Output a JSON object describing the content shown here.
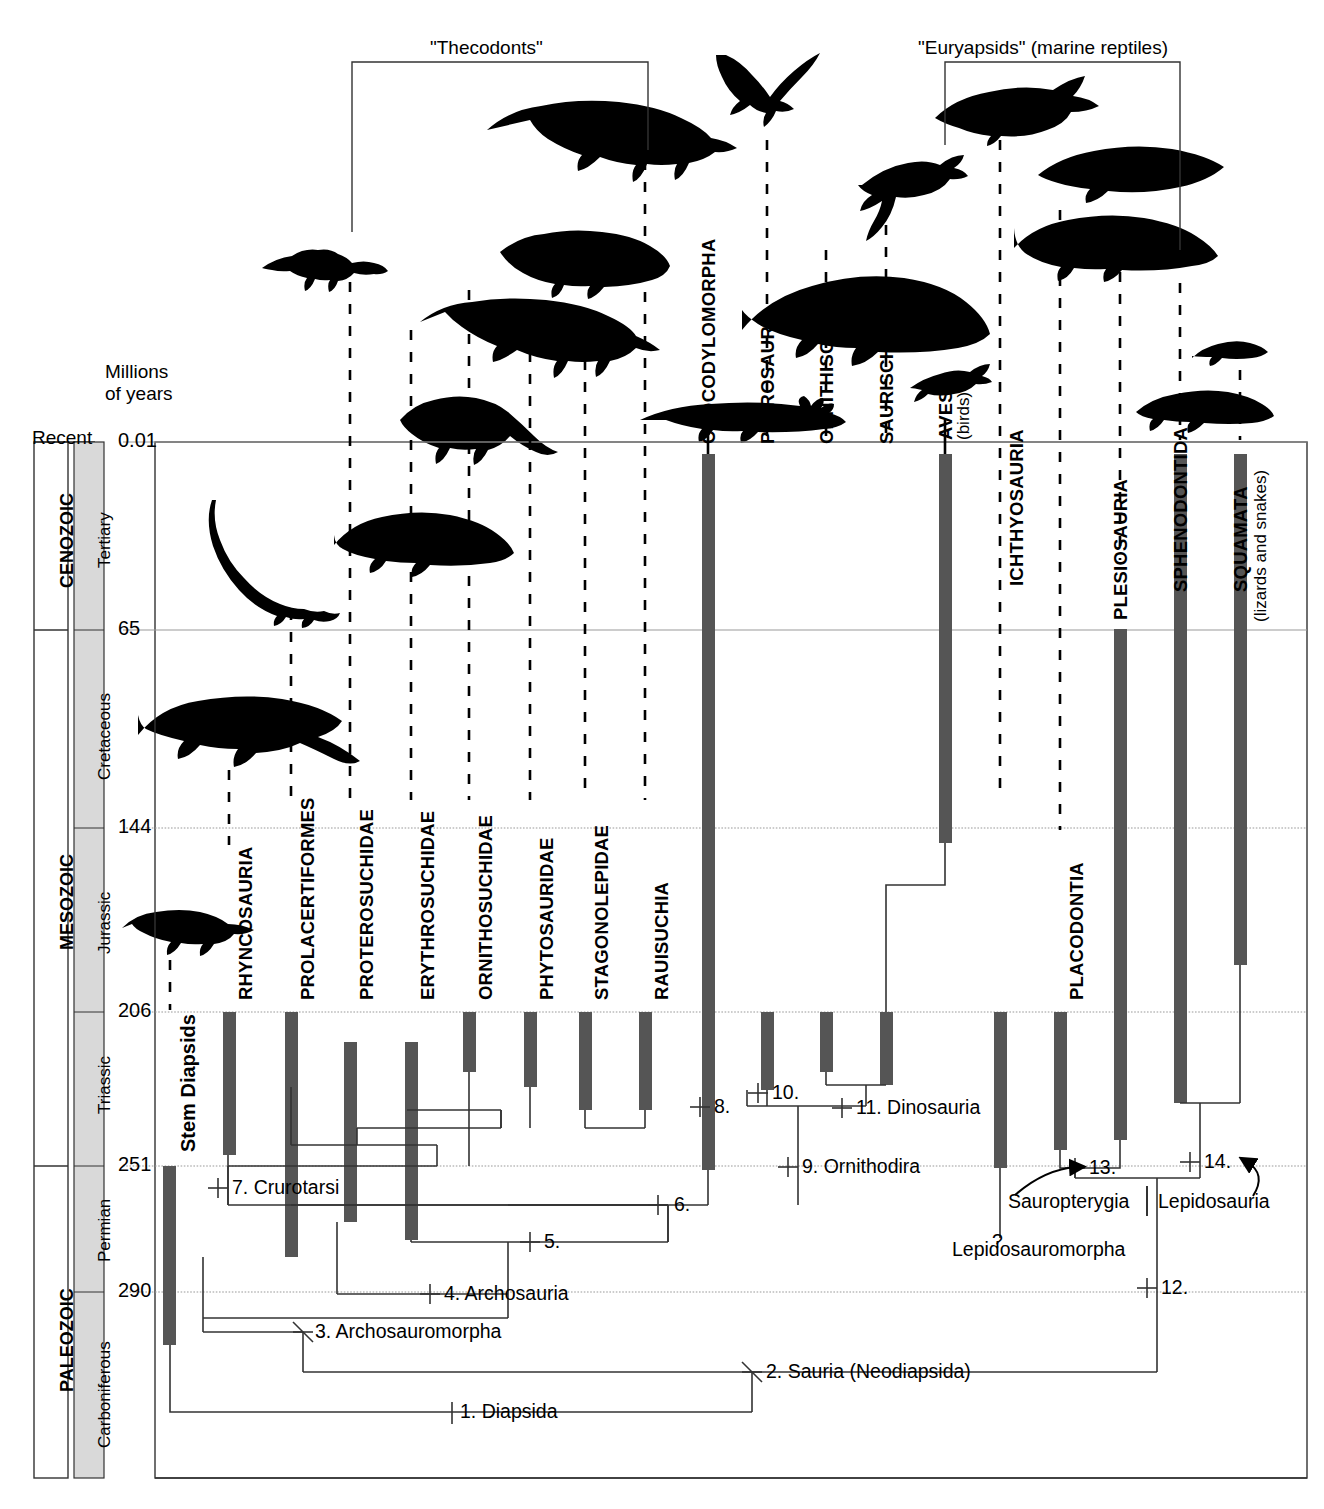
{
  "figure": {
    "title_brackets": [
      {
        "id": "thecodonts",
        "label": "\"Thecodonts\"",
        "x1": 352,
        "x2": 648,
        "y": 62,
        "label_x": 500,
        "label_y": 52
      },
      {
        "id": "euryapsids",
        "label": "\"Euryapsids\" (marine reptiles)",
        "x1": 945,
        "x2": 1180,
        "y": 62,
        "label_x": 1063,
        "label_y": 52
      }
    ],
    "axis_header": {
      "line1": "Millions",
      "line2": "of years",
      "x": 105,
      "y": 370
    },
    "recent_label": "Recent",
    "stem_label": "Stem Diapsids"
  },
  "time_axis": {
    "ticks": [
      {
        "value": "0.01",
        "y": 442
      },
      {
        "value": "65",
        "y": 630
      },
      {
        "value": "144",
        "y": 828
      },
      {
        "value": "206",
        "y": 1012
      },
      {
        "value": "251",
        "y": 1166
      },
      {
        "value": "290",
        "y": 1292
      }
    ],
    "eras": [
      {
        "name": "CENOZOIC",
        "y_top": 442,
        "y_bottom": 630
      },
      {
        "name": "MESOZOIC",
        "y_top": 630,
        "y_bottom": 1166
      },
      {
        "name": "PALEOZOIC",
        "y_top": 1166,
        "y_bottom": 1478
      }
    ],
    "periods": [
      {
        "name": "Tertiary",
        "y_top": 442,
        "y_bottom": 630
      },
      {
        "name": "Cretaceous",
        "y_top": 630,
        "y_bottom": 828
      },
      {
        "name": "Jurassic",
        "y_top": 828,
        "y_bottom": 1012
      },
      {
        "name": "Triassic",
        "y_top": 1012,
        "y_bottom": 1166
      },
      {
        "name": "Permian",
        "y_top": 1166,
        "y_bottom": 1292
      },
      {
        "name": "Carboniferous",
        "y_top": 1292,
        "y_bottom": 1478
      }
    ]
  },
  "taxa": [
    {
      "id": "stem-diapsids",
      "label": "Stem Diapsids",
      "x": 170,
      "bar_top": 1166,
      "bar_bottom": 1345,
      "label_y": 1155,
      "vertical": true,
      "bold": true,
      "dashed_top": null
    },
    {
      "id": "rhyncosauria",
      "label": "RHYNCOSAURIA",
      "x": 229,
      "bar_top": 1012,
      "bar_bottom": 1155,
      "label_y": 1000,
      "dashed_top": 200
    },
    {
      "id": "prolacertiformes",
      "label": "PROLACERTIFORMES",
      "x": 291,
      "bar_top": 1012,
      "bar_bottom": 1257,
      "label_y": 1000,
      "dashed_top": 600
    },
    {
      "id": "proterosuchidae",
      "label": "PROTEROSUCHIDAE",
      "x": 350,
      "bar_top": 1042,
      "bar_bottom": 1222,
      "label_y": 1000,
      "dashed_top": 90
    },
    {
      "id": "erythrosuchidae",
      "label": "ERYTHROSUCHIDAE",
      "x": 411,
      "bar_top": 1042,
      "bar_bottom": 1240,
      "label_y": 1000,
      "dashed_top": 290
    },
    {
      "id": "ornithosuchidae",
      "label": "ORNITHOSUCHIDAE",
      "x": 469,
      "bar_top": 1012,
      "bar_bottom": 1072,
      "label_y": 1000,
      "dashed_top": 250
    },
    {
      "id": "phytosauridae",
      "label": "PHYTOSAURIDAE",
      "x": 530,
      "bar_top": 1012,
      "bar_bottom": 1087,
      "label_y": 1000,
      "dashed_top": 280
    },
    {
      "id": "stagonolepidae",
      "label": "STAGONOLEPIDAE",
      "x": 585,
      "bar_top": 1012,
      "bar_bottom": 1110,
      "label_y": 1000,
      "dashed_top": 350
    },
    {
      "id": "rauisuchia",
      "label": "RAUISUCHIA",
      "x": 645,
      "bar_top": 1012,
      "bar_bottom": 1110,
      "label_y": 1000,
      "dashed_top": 150
    },
    {
      "id": "crocodylomorpha",
      "label": "CROCODYLOMORPHA",
      "x": 708,
      "bar_top": 454,
      "bar_bottom": 1170,
      "label_y": 444,
      "dashed_top": null
    },
    {
      "id": "pterosauria",
      "label": "PTEROSAURIA",
      "x": 767,
      "bar_top": 1012,
      "bar_bottom": 1090,
      "label_y": 1000,
      "dashed_top": 75
    },
    {
      "id": "ornithischia",
      "label": "ORNITHISCHIA",
      "x": 826,
      "bar_top": 1012,
      "bar_bottom": 1072,
      "label_y": 1000,
      "dashed_top": 165
    },
    {
      "id": "saurischia",
      "label": "SAURISCHIA",
      "x": 886,
      "bar_top": 1012,
      "bar_bottom": 1085,
      "label_y": 1000,
      "dashed_top": 170
    },
    {
      "id": "aves",
      "label": "AVES",
      "sublabel": "(birds)",
      "x": 945,
      "bar_top": 454,
      "bar_bottom": 843,
      "label_y": 440,
      "dashed_top": null
    },
    {
      "id": "ichthyosauria",
      "label": "ICHTHYOSAURIA",
      "x": 1000,
      "bar_top": 1012,
      "bar_bottom": 1168,
      "label_y": 1000,
      "dashed_top": 90
    },
    {
      "id": "placodontia",
      "label": "PLACODONTIA",
      "x": 1060,
      "bar_top": 1012,
      "bar_bottom": 1150,
      "label_y": 1000,
      "dashed_top": 140
    },
    {
      "id": "plesiosauria",
      "label": "PLESIOSAURIA",
      "x": 1120,
      "bar_top": 629,
      "bar_bottom": 1140,
      "label_y": 620,
      "dashed_top": 150
    },
    {
      "id": "sphenodontida",
      "label": "SPHENODONTIDA",
      "x": 1180,
      "bar_top": 454,
      "bar_bottom": 1103,
      "label_y": 444,
      "dashed_top": null
    },
    {
      "id": "squamata",
      "label": "SQUAMATA",
      "sublabel": "(lizards and snakes)",
      "x": 1240,
      "bar_top": 454,
      "bar_bottom": 965,
      "label_y": 444,
      "dashed_top": null
    }
  ],
  "nodes": [
    {
      "num": "1.",
      "name": "Diapsida",
      "label": "1. Diapsida",
      "x": 452,
      "y": 1412
    },
    {
      "num": "2.",
      "name": "Sauria (Neodiapsida)",
      "label": "2. Sauria (Neodiapsida)",
      "x": 752,
      "y": 1372
    },
    {
      "num": "3.",
      "name": "Archosauromorpha",
      "label": "3. Archosauromorpha",
      "x": 303,
      "y": 1332
    },
    {
      "num": "4.",
      "name": "Archosauria",
      "label": "4. Archosauria",
      "x": 440,
      "y": 1294
    },
    {
      "num": "5.",
      "name": "",
      "label": "5.",
      "x": 540,
      "y": 1242
    },
    {
      "num": "6.",
      "name": "",
      "label": "6.",
      "x": 668,
      "y": 1205
    },
    {
      "num": "7.",
      "name": "Crurotarsi",
      "label": "7. Crurotarsi",
      "x": 527,
      "y": 1188
    },
    {
      "num": "8.",
      "name": "",
      "label": "8.",
      "x": 710,
      "y": 1107
    },
    {
      "num": "9.",
      "name": "Ornithodira",
      "label": "9. Ornithodira",
      "x": 808,
      "y": 1167
    },
    {
      "num": "10.",
      "name": "",
      "label": "10.",
      "x": 768,
      "y": 1093
    },
    {
      "num": "11.",
      "name": "Dinosauria",
      "label": "11. Dinosauria",
      "x": 852,
      "y": 1108
    },
    {
      "num": "12.",
      "name": "",
      "label": "12.",
      "x": 1157,
      "y": 1288
    },
    {
      "num": "13.",
      "name": "",
      "label": "13.",
      "x": 1085,
      "y": 1168
    },
    {
      "num": "14.",
      "name": "",
      "label": "14.",
      "x": 1200,
      "y": 1162
    }
  ],
  "annotations": [
    {
      "id": "sauropterygia",
      "label": "Sauropterygia",
      "x": 1008,
      "y": 1203
    },
    {
      "id": "lepidosauria",
      "label": "Lepidosauria",
      "x": 1158,
      "y": 1203
    },
    {
      "id": "lepidosauromorpha",
      "label": "Lepidosauromorpha",
      "x": 952,
      "y": 1250
    },
    {
      "id": "question-mark",
      "label": "?",
      "x": 996,
      "y": 1238
    }
  ],
  "colors": {
    "bar": "#555555",
    "gridline": "#999999",
    "branch": "#333333",
    "period_band": "#d9d9d9",
    "silhouette": "#000000",
    "background": "#ffffff"
  }
}
